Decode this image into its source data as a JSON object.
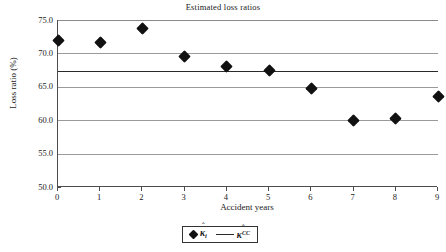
{
  "chart_data": {
    "type": "scatter",
    "title": "Estimated loss ratios",
    "xlabel": "Accident years",
    "ylabel": "Loss ratio (%)",
    "x": [
      0,
      1,
      2,
      3,
      4,
      5,
      6,
      7,
      8,
      9
    ],
    "categories": [
      "0",
      "1",
      "2",
      "3",
      "4",
      "5",
      "6",
      "7",
      "8",
      "9"
    ],
    "xlim": [
      0,
      9
    ],
    "ylim": [
      50.0,
      75.0
    ],
    "yticks": [
      50.0,
      55.0,
      60.0,
      65.0,
      70.0,
      75.0
    ],
    "ytick_labels": [
      "50.0",
      "55.0",
      "60.0",
      "65.0",
      "70.0",
      "75.0"
    ],
    "grid": "horizontal",
    "legend_position": "bottom",
    "series": [
      {
        "name": "kappa-hat-i",
        "label_plain": "k̂ᵢ",
        "marker": "diamond",
        "type": "scatter",
        "values": [
          72.0,
          71.7,
          73.8,
          69.5,
          68.1,
          67.4,
          64.7,
          60.0,
          60.2,
          63.5
        ]
      },
      {
        "name": "kappa-hat-CC",
        "label_plain": "k̂^CC",
        "marker": "line",
        "type": "horizontal-line",
        "value": 67.3
      }
    ]
  },
  "legend": {
    "entries": [
      {
        "symbol": "κ",
        "hat": "ˆ",
        "subscript": "i",
        "superscript": "",
        "marker": "diamond"
      },
      {
        "symbol": "κ",
        "hat": "ˆ",
        "subscript": "",
        "superscript": "CC",
        "marker": "line"
      }
    ]
  }
}
